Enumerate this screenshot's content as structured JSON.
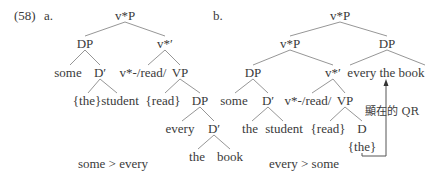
{
  "example": {
    "number": "(58)",
    "panel_a_label": "a.",
    "panel_b_label": "b."
  },
  "tree_a": {
    "root": "v*P",
    "dp": "DP",
    "vbar": "v*′",
    "some": "some",
    "dbar": "D′",
    "v_read": "v*-/read/",
    "vp": "VP",
    "the_braced": "{the}",
    "student": "student",
    "read_braced": "{read}",
    "dp2": "DP",
    "every": "every",
    "dbar2": "D′",
    "the": "the",
    "book": "book",
    "scope": "some > every"
  },
  "tree_b": {
    "root": "v*P",
    "vstarp": "v*P",
    "dp_top": "DP",
    "dp": "DP",
    "vbar": "v*′",
    "every_the_book": "every the book",
    "some": "some",
    "dbar": "D′",
    "v_read": "v*-/read/",
    "vp": "VP",
    "the": "the",
    "student": "student",
    "read_braced": "{read}",
    "d": "D",
    "the_braced": "{the}",
    "qr_label": "顯在的 QR",
    "scope": "every > some"
  },
  "colors": {
    "text": "#3a3a3a",
    "branch": "#8a8a8a",
    "arrow": "#555555"
  }
}
